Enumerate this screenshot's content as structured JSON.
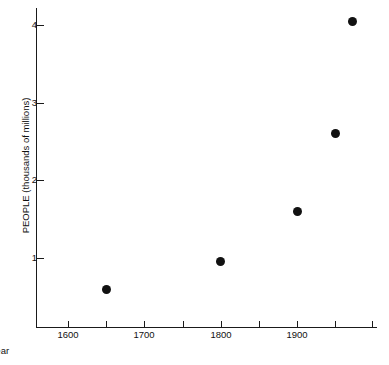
{
  "chart_data": {
    "type": "scatter",
    "title": "",
    "xlabel": "Year",
    "ylabel": "PEOPLE (thousands of millions)",
    "xlim": [
      1555,
      2001
    ],
    "ylim": [
      0,
      4.3
    ],
    "grid": false,
    "legend": "none",
    "x": [
      1650,
      1800,
      1900,
      1950,
      1972
    ],
    "values": [
      0.6,
      0.95,
      1.6,
      2.6,
      4.05
    ],
    "points": [
      {
        "x": 1650,
        "y": 0.6
      },
      {
        "x": 1800,
        "y": 0.95
      },
      {
        "x": 1900,
        "y": 1.6
      },
      {
        "x": 1950,
        "y": 2.6
      },
      {
        "x": 1972,
        "y": 4.05
      }
    ],
    "x_ticks_major": [
      1600,
      1700,
      1800,
      1900
    ],
    "x_tick_labels": [
      "1600",
      "1700",
      "1800",
      "1900"
    ],
    "x_ticks_minor": [
      1650,
      1750,
      1850,
      1950,
      2000
    ],
    "y_ticks": [
      1,
      2,
      3,
      4
    ],
    "y_tick_labels": [
      "1",
      "2",
      "3",
      "4"
    ],
    "marker": "filled-circle",
    "marker_color": "#111111",
    "axis_color": "#1a1a1a"
  }
}
